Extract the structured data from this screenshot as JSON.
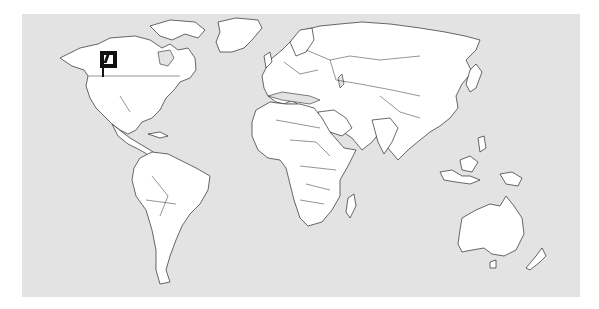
{
  "map": {
    "type": "world-political-outline",
    "ocean_color": "#e3e3e3",
    "land_color": "#ffffff",
    "border_color": "#2a2a2a",
    "continents": [
      "North America",
      "South America",
      "Europe",
      "Africa",
      "Asia",
      "Australia",
      "Greenland"
    ]
  },
  "marker": {
    "icon": "leaf-icon",
    "location_label": "Pacific Northwest, North America",
    "color": "#111111"
  }
}
